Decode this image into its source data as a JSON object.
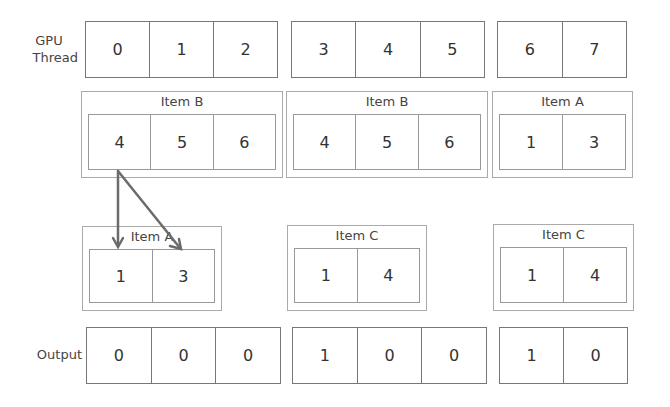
{
  "labels": {
    "gpu_thread_line1": "GPU",
    "gpu_thread_line2": "Thread",
    "output": "Output"
  },
  "gpu_threads": {
    "groups": [
      [
        "0",
        "1",
        "2"
      ],
      [
        "3",
        "4",
        "5"
      ],
      [
        "6",
        "7"
      ]
    ]
  },
  "input_items": [
    {
      "title": "Item B",
      "values": [
        "4",
        "5",
        "6"
      ]
    },
    {
      "title": "Item B",
      "values": [
        "4",
        "5",
        "6"
      ]
    },
    {
      "title": "Item A",
      "values": [
        "1",
        "3"
      ]
    }
  ],
  "lookup_items": [
    {
      "title": "Item A",
      "values": [
        "1",
        "3"
      ]
    },
    {
      "title": "Item C",
      "values": [
        "1",
        "4"
      ]
    },
    {
      "title": "Item C",
      "values": [
        "1",
        "4"
      ]
    }
  ],
  "output": {
    "groups": [
      [
        "0",
        "0",
        "0"
      ],
      [
        "1",
        "0",
        "0"
      ],
      [
        "1",
        "0"
      ]
    ]
  },
  "arrows": [
    {
      "from": "input_items.0.values.0",
      "to": "lookup_items.0.values.0"
    },
    {
      "from": "input_items.0.values.0",
      "to": "lookup_items.0.values.1"
    }
  ],
  "colors": {
    "border": "#777777",
    "item_border": "#aaaaaa",
    "arrow": "#6b6b6b"
  }
}
